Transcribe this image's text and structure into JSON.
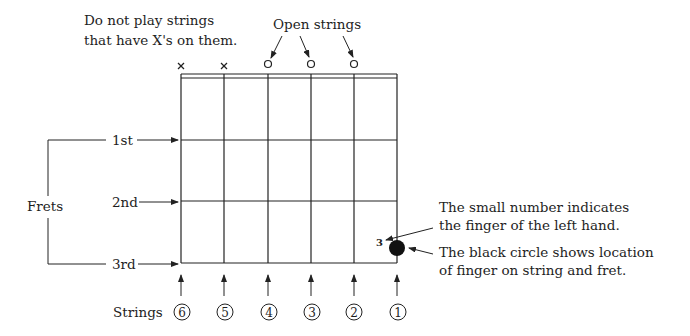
{
  "annotations": {
    "muted_note_line1": "Do not play strings",
    "muted_note_line2": "that have X's on them.",
    "open_strings_label": "Open strings",
    "frets_label": "Frets",
    "fret_labels": [
      "1st",
      "2nd",
      "3rd"
    ],
    "finger_number_note_line1": "The small number indicates",
    "finger_number_note_line2": "the finger of the left hand.",
    "black_circle_note_line1": "The black circle shows location",
    "black_circle_note_line2": "of finger on string and fret.",
    "strings_label": "Strings"
  },
  "strings": [
    {
      "number": "6",
      "label": "⑥",
      "marker": "×",
      "state": "muted"
    },
    {
      "number": "5",
      "label": "⑤",
      "marker": "×",
      "state": "muted"
    },
    {
      "number": "4",
      "label": "④",
      "marker": "○",
      "state": "open"
    },
    {
      "number": "3",
      "label": "③",
      "marker": "○",
      "state": "open"
    },
    {
      "number": "2",
      "label": "②",
      "marker": "○",
      "state": "open"
    },
    {
      "number": "1",
      "label": "①",
      "marker": "",
      "state": "fretted"
    }
  ],
  "finger_dot": {
    "string": 1,
    "fret": 3,
    "finger": "3",
    "color": "#111111"
  }
}
